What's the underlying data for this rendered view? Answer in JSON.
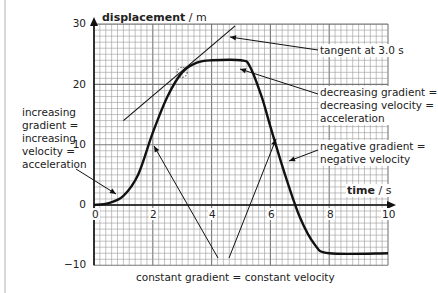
{
  "chart_data": {
    "type": "line",
    "title": "",
    "xlabel": "time / s",
    "ylabel": "displacement / m",
    "xlim": [
      0,
      10
    ],
    "ylim": [
      -10,
      30
    ],
    "grid": true,
    "x_ticks": [
      "0",
      "2",
      "4",
      "6",
      "8",
      "10"
    ],
    "y_ticks": [
      "30",
      "20",
      "10",
      "0",
      "-10"
    ],
    "series": [
      {
        "name": "displacement-time",
        "x": [
          0,
          0.5,
          1,
          1.5,
          2,
          2.5,
          3,
          3.5,
          4,
          5,
          5.3,
          5.7,
          6,
          6.5,
          7,
          7.5,
          8,
          10
        ],
        "y": [
          0,
          0.3,
          1.5,
          5,
          12,
          18,
          22,
          23.6,
          24,
          24,
          23,
          18,
          13,
          5,
          -2,
          -6.5,
          -8,
          -8
        ]
      },
      {
        "name": "tangent at 3.0 s",
        "x": [
          1.0,
          4.8
        ],
        "y": [
          14,
          29.7
        ]
      }
    ],
    "annotations": [
      "tangent at 3.0 s",
      "decreasing gradient = decreasing velocity = acceleration",
      "increasing gradient = increasing velocity = acceleration",
      "negative gradient = negative velocity",
      "constant gradient = constant velocity"
    ]
  },
  "axes": {
    "y_title_bold": "displacement",
    "y_title_unit": " / m",
    "x_title_bold": "time",
    "x_title_unit": " / s",
    "x_ticks": [
      "0",
      "2",
      "4",
      "6",
      "8",
      "10"
    ],
    "y_ticks": [
      "30",
      "20",
      "10",
      "0",
      "−10"
    ]
  },
  "labels": {
    "tangent": "tangent at 3.0 s",
    "decreasing": [
      "decreasing gradient =",
      "decreasing velocity =",
      "acceleration"
    ],
    "increasing": [
      "increasing",
      "gradient =",
      "increasing",
      "velocity =",
      "acceleration"
    ],
    "negative": [
      "negative gradient =",
      "negative velocity"
    ],
    "constant": "constant gradient = constant velocity"
  }
}
